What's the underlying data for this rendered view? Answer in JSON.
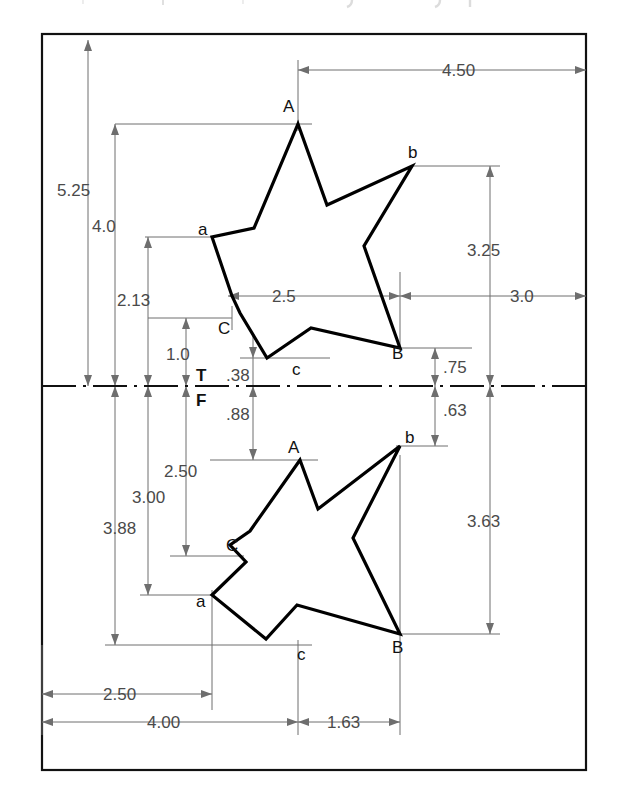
{
  "drawing": {
    "title": "Two-view orthographic star drawing",
    "units": "inches",
    "border_color": "#111111",
    "object_line_color": "#000000",
    "dimension_line_color": "#6e6e6e",
    "background": "#ffffff"
  },
  "centerline": {
    "label_above": "T",
    "label_below": "F",
    "style": "dash-dot"
  },
  "views": {
    "top": {
      "name": "top-view-star",
      "vertex_labels": [
        "A",
        "b",
        "B",
        "c",
        "C",
        "a"
      ],
      "points": {
        "A": "A",
        "b": "b",
        "B": "B",
        "c": "c",
        "C": "C",
        "a": "a"
      }
    },
    "front": {
      "name": "front-view-star",
      "vertex_labels": [
        "A",
        "b",
        "B",
        "c",
        "a",
        "C"
      ],
      "points": {
        "A": "A",
        "b": "b",
        "B": "B",
        "c": "c",
        "a": "a",
        "C": "C"
      }
    }
  },
  "dimensions": {
    "horizontal": [
      {
        "id": "dim-4-50",
        "value": "4.50"
      },
      {
        "id": "dim-2-5",
        "value": "2.5"
      },
      {
        "id": "dim-3-0",
        "value": "3.0"
      },
      {
        "id": "dim-2-50-bottom",
        "value": "2.50"
      },
      {
        "id": "dim-4-00",
        "value": "4.00"
      },
      {
        "id": "dim-1-63",
        "value": "1.63"
      }
    ],
    "vertical_above_centerline": [
      {
        "id": "dim-5-25",
        "value": "5.25"
      },
      {
        "id": "dim-4-0",
        "value": "4.0"
      },
      {
        "id": "dim-2-13",
        "value": "2.13"
      },
      {
        "id": "dim-1-0",
        "value": "1.0"
      },
      {
        "id": "dim-0-38",
        "value": ".38"
      },
      {
        "id": "dim-3-25",
        "value": "3.25"
      },
      {
        "id": "dim-0-75",
        "value": ".75"
      }
    ],
    "vertical_below_centerline": [
      {
        "id": "dim-0-88",
        "value": ".88"
      },
      {
        "id": "dim-2-50",
        "value": "2.50"
      },
      {
        "id": "dim-3-00",
        "value": "3.00"
      },
      {
        "id": "dim-3-88",
        "value": "3.88"
      },
      {
        "id": "dim-0-63",
        "value": ".63"
      },
      {
        "id": "dim-3-63",
        "value": "3.63"
      }
    ]
  },
  "labels": {
    "dim_4_50": "4.50",
    "dim_5_25": "5.25",
    "dim_4_0": "4.0",
    "dim_2_13": "2.13",
    "dim_1_0": "1.0",
    "dim_0_38": ".38",
    "dim_2_5": "2.5",
    "dim_3_25": "3.25",
    "dim_3_0": "3.0",
    "dim_0_75": ".75",
    "dim_0_88": ".88",
    "dim_0_63": ".63",
    "dim_2_50_mid": "2.50",
    "dim_3_00": "3.00",
    "dim_3_88": "3.88",
    "dim_3_63": "3.63",
    "dim_2_50_bottom": "2.50",
    "dim_4_00": "4.00",
    "dim_1_63": "1.63",
    "t": "T",
    "f": "F",
    "top_A": "A",
    "top_b": "b",
    "top_a": "a",
    "top_B": "B",
    "top_C": "C",
    "top_c": "c",
    "front_A": "A",
    "front_b": "b",
    "front_C": "C",
    "front_a": "a",
    "front_B": "B",
    "front_c": "c"
  }
}
